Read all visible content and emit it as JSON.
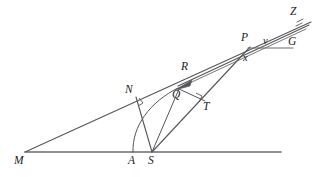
{
  "figure": {
    "kind": "geometry-diagram",
    "background_color": "#ffffff",
    "stroke_color": "#55555a",
    "label_color": "#1a1a1a",
    "width": 320,
    "height": 177
  },
  "labels": {
    "M": "M",
    "A": "A",
    "S": "S",
    "N": "N",
    "Q": "Q",
    "R": "R",
    "T": "T",
    "P": "P",
    "v": "v",
    "x": "x",
    "G": "G",
    "Z": "Z"
  },
  "points": {
    "M": [
      25,
      152
    ],
    "A": [
      133,
      152
    ],
    "S": [
      152,
      152
    ],
    "N": [
      136,
      97
    ],
    "Q": [
      180,
      88
    ],
    "R": [
      190,
      73
    ],
    "T": [
      204,
      101
    ],
    "P": [
      249,
      48
    ],
    "G": [
      292,
      47
    ],
    "Z": [
      310,
      20
    ],
    "baseline_end": [
      281,
      152
    ]
  },
  "segments": [
    {
      "name": "baseline-MS-extended",
      "from": "M",
      "to": "baseline_end"
    },
    {
      "name": "ray-M-through-N-to-Z",
      "from": "M",
      "to": "Z"
    },
    {
      "name": "segment-S-to-N",
      "from": "S",
      "to": "N"
    },
    {
      "name": "segment-S-to-T-to-P",
      "from": "S",
      "to": "P"
    },
    {
      "name": "segment-S-to-Q",
      "from": "S",
      "to": "Q"
    },
    {
      "name": "segment-Q-to-T",
      "from": "Q",
      "to": "T"
    },
    {
      "name": "segment-Q-to-P",
      "from": "Q",
      "to": "P"
    },
    {
      "name": "horizontal-P-to-G",
      "from": "P",
      "to": "G"
    },
    {
      "name": "ray-Q-to-Z-upper",
      "from": "Q",
      "to": "Z"
    }
  ],
  "arcs": [
    {
      "name": "arc-A-to-Q",
      "from": "A",
      "to": "Q",
      "center": "S"
    }
  ],
  "markers": {
    "right_angle_at_N": true,
    "right_angle_at_T": true,
    "arrowhead_near_Q": true,
    "hatch_near_Z": true
  }
}
